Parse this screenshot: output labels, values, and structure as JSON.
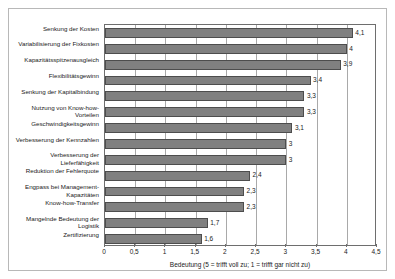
{
  "chart_data": {
    "type": "bar",
    "orientation": "horizontal",
    "title": "",
    "xlabel": "Bedeutung (5 = trifft voll zu; 1 = trifft gar nicht zu)",
    "ylabel": "",
    "xlim": [
      0,
      4.5
    ],
    "grid": true,
    "legend": false,
    "xticks": [
      "0",
      "0,5",
      "1",
      "1,5",
      "2",
      "2,5",
      "3",
      "3,5",
      "4",
      "4,5"
    ],
    "xtick_values": [
      0,
      0.5,
      1,
      1.5,
      2,
      2.5,
      3,
      3.5,
      4,
      4.5
    ],
    "bar_color": "#808080",
    "bar_border_color": "#4d4d4d",
    "categories": [
      "Senkung der Kosten",
      "Variabilisierung der Fixkosten",
      "Kapazitätsspitzenausgleich",
      "Flexibilitätsgewinn",
      "Senkung der Kapitalbindung",
      "Nutzung von Know-how-Vorteilen",
      "Geschwindigkeitsgewinn",
      "Verbesserung der Kennzahlen",
      "Verbesserung der Lieferfähigkeit",
      "Reduktion der Fehlerquote",
      "Engpass bei Management-Kapazitäten",
      "Know-how-Transfer",
      "Mangelnde Bedeutung der Logistik",
      "Zertifizierung"
    ],
    "values": [
      4.1,
      4,
      3.9,
      3.4,
      3.3,
      3.3,
      3.1,
      3,
      3,
      2.4,
      2.3,
      2.3,
      1.7,
      1.6
    ],
    "value_labels": [
      "4,1",
      "4",
      "3,9",
      "3,4",
      "3,3",
      "3,3",
      "3,1",
      "3",
      "3",
      "2,4",
      "2,3",
      "2,3",
      "1,7",
      "1,6"
    ]
  }
}
